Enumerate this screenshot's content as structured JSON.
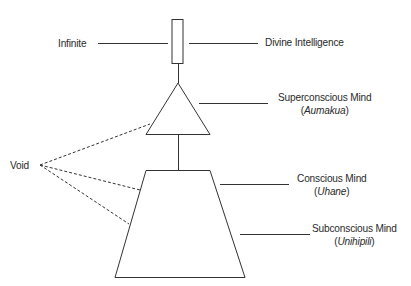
{
  "diagram": {
    "labels": {
      "infinite": "Infinite",
      "divine": "Divine Intelligence",
      "superconscious": "Superconscious Mind",
      "superconscious_sub": "Aumakua",
      "conscious": "Conscious Mind",
      "conscious_sub": "Uhane",
      "subconscious": "Subconscious Mind",
      "subconscious_sub": "Unihipili",
      "void": "Void"
    },
    "shapes": {
      "rectangle": "Infinite / Divine Intelligence",
      "triangle": "Superconscious Mind",
      "trapezoid": "Conscious and Subconscious Mind"
    },
    "colors": {
      "stroke": "#333333",
      "text": "#2a2a2a",
      "background": "#ffffff"
    }
  }
}
